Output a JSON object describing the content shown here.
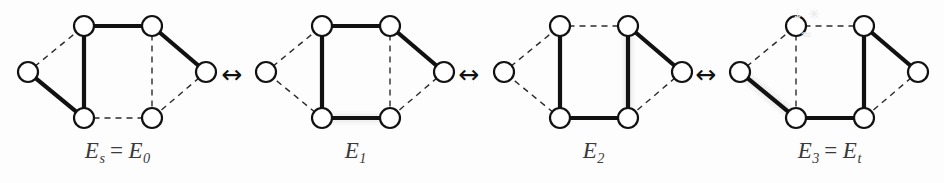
{
  "figure": {
    "background_color": "#fdfdfd",
    "node_fill": "#ffffff",
    "node_stroke": "#111111",
    "solid_edge_color": "#111111",
    "dashed_edge_color": "#2b2b2b",
    "highlight_halo_color": "#b9b9b9",
    "label_color": "#3a3a3a",
    "arrow_color": "#111111",
    "watermark_text": "⇣ ✳ ≈"
  },
  "node_layout": {
    "names": [
      "left",
      "top-left",
      "top-right",
      "right",
      "bottom-right",
      "bottom-left"
    ],
    "points": [
      {
        "id": "L",
        "x": 18,
        "y": 68
      },
      {
        "id": "TL",
        "x": 74,
        "y": 22
      },
      {
        "id": "TR",
        "x": 142,
        "y": 22
      },
      {
        "id": "R",
        "x": 196,
        "y": 68
      },
      {
        "id": "BR",
        "x": 142,
        "y": 114
      },
      {
        "id": "BL",
        "x": 74,
        "y": 114
      }
    ],
    "radius": 10
  },
  "edge_order": [
    "L-TL",
    "TL-TR",
    "TR-R",
    "R-BR",
    "BR-BL",
    "BL-L",
    "TL-BL",
    "TR-BR"
  ],
  "panels": [
    {
      "id": "panel-0",
      "left": 10,
      "label": {
        "main": "E",
        "sub": "s",
        "eq": "=",
        "main2": "E",
        "sub2": "0",
        "plain": "Es = E0"
      },
      "edges": {
        "L-TL": "dashed",
        "TL-TR": "solid",
        "TR-R": "solid",
        "R-BR": "dashed",
        "BR-BL": "dashed",
        "BL-L": "solid",
        "TL-BL": "solid",
        "TR-BR": "dashed"
      }
    },
    {
      "id": "panel-1",
      "left": 248,
      "label": {
        "main": "E",
        "sub": "1",
        "eq": "",
        "main2": "",
        "sub2": "",
        "plain": "E1"
      },
      "edges": {
        "L-TL": "dashed",
        "TL-TR": "solid",
        "TR-R": "solid",
        "R-BR": "dashed",
        "BR-BL": "highlight",
        "BL-L": "dashed",
        "TL-BL": "solid",
        "TR-BR": "dashed"
      }
    },
    {
      "id": "panel-2",
      "left": 486,
      "label": {
        "main": "E",
        "sub": "2",
        "eq": "",
        "main2": "",
        "sub2": "",
        "plain": "E2"
      },
      "edges": {
        "L-TL": "dashed",
        "TL-TR": "dashed",
        "TR-R": "solid",
        "R-BR": "dashed",
        "BR-BL": "solid",
        "BL-L": "dashed",
        "TL-BL": "solid",
        "TR-BR": "highlight"
      }
    },
    {
      "id": "panel-3",
      "left": 722,
      "label": {
        "main": "E",
        "sub": "3",
        "eq": "=",
        "main2": "E",
        "sub2": "t",
        "plain": "E3 = Et"
      },
      "edges": {
        "L-TL": "dashed",
        "TL-TR": "dashed",
        "TR-R": "solid",
        "R-BR": "dashed",
        "BR-BL": "solid",
        "BL-L": "highlight",
        "TL-BL": "dashed",
        "TR-BR": "solid"
      }
    }
  ],
  "arrows": [
    {
      "id": "arrow-0",
      "glyph": "↔",
      "left": 212
    },
    {
      "id": "arrow-1",
      "glyph": "↔",
      "left": 449
    },
    {
      "id": "arrow-2",
      "glyph": "↔",
      "left": 686
    }
  ]
}
